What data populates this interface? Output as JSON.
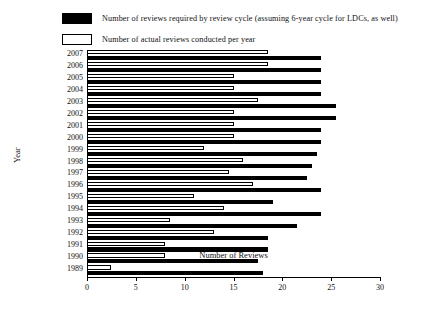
{
  "legend": {
    "items": [
      {
        "swatch": "filled",
        "label": "Number of reviews required by review cycle (assuming 6-year cycle for LDCs, as well)"
      },
      {
        "swatch": "hollow",
        "label": "Number of actual reviews conducted per year"
      }
    ]
  },
  "chart_data": {
    "type": "bar",
    "orientation": "horizontal",
    "title": "",
    "xlabel": "Number of Reviews",
    "ylabel": "Year",
    "xlim": [
      0,
      30
    ],
    "ylim": null,
    "grid": false,
    "legend_position": "above-plot",
    "xticks": [
      0,
      5,
      10,
      15,
      20,
      25,
      30
    ],
    "categories": [
      "2007",
      "2006",
      "2005",
      "2004",
      "2003",
      "2002",
      "2001",
      "2000",
      "1999",
      "1998",
      "1997",
      "1996",
      "1995",
      "1994",
      "1993",
      "1992",
      "1991",
      "1990",
      "1989"
    ],
    "series": [
      {
        "name": "Number of actual reviews conducted per year",
        "color": "#ffffff",
        "values": [
          18.5,
          18.5,
          15,
          15,
          17.5,
          15,
          15,
          15,
          12,
          16,
          14.5,
          17,
          11,
          14,
          8.5,
          13,
          8,
          8,
          2.5
        ]
      },
      {
        "name": "Number of reviews required by review cycle (assuming 6-year cycle for LDCs, as well)",
        "color": "#000000",
        "values": [
          24,
          24,
          24,
          24,
          25.5,
          25.5,
          24,
          24,
          23.5,
          23,
          22.5,
          24,
          19,
          24,
          21.5,
          18.5,
          18.5,
          17.5,
          18
        ]
      }
    ]
  }
}
